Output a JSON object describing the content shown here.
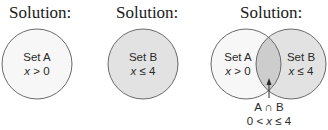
{
  "panels": [
    {
      "title": "Solution:",
      "sets": [
        {
          "name": "Set A",
          "condition_var": "x",
          "condition_rest": " > 0"
        }
      ]
    },
    {
      "title": "Solution:",
      "sets": [
        {
          "name": "Set B",
          "condition_var": "x",
          "condition_rest": " ≤ 4"
        }
      ]
    },
    {
      "title": "Solution:",
      "sets": [
        {
          "name": "Set A",
          "condition_var": "x",
          "condition_rest": " > 0"
        },
        {
          "name": "Set B",
          "condition_var": "x",
          "condition_rest": " ≤ 4"
        }
      ],
      "intersection": {
        "label": "A ∩ B",
        "condition_pre": "0 < ",
        "condition_var": "x",
        "condition_rest": " ≤ 4"
      }
    }
  ],
  "colors": {
    "set_a_fill": "#f7f7f7",
    "set_b_fill": "#e2e2e2",
    "intersection_fill": "#cdcdcd",
    "stroke": "#6a6a6a"
  }
}
